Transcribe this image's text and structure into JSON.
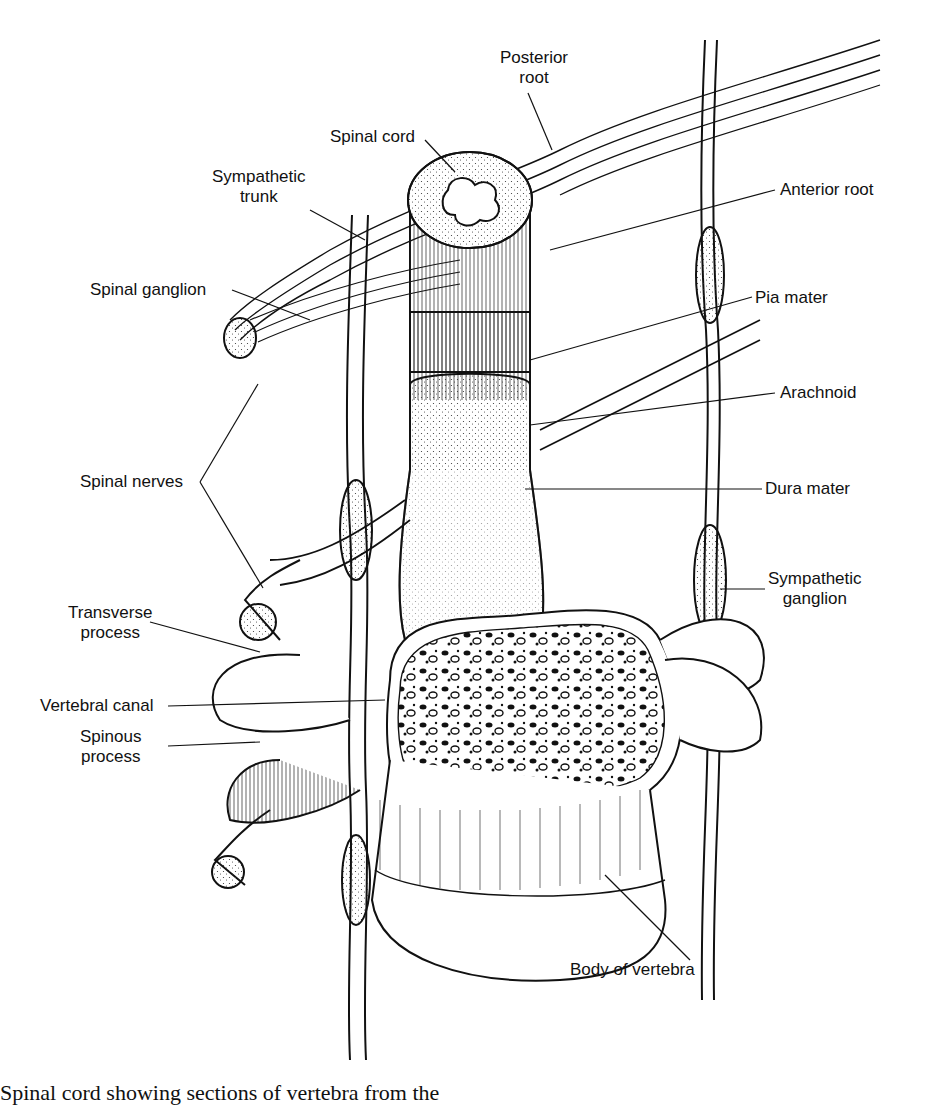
{
  "figure": {
    "labels": {
      "posterior_root": "Posterior\nroot",
      "spinal_cord": "Spinal cord",
      "sympathetic_trunk": "Sympathetic\ntrunk",
      "anterior_root": "Anterior root",
      "spinal_ganglion": "Spinal ganglion",
      "pia_mater": "Pia mater",
      "arachnoid": "Arachnoid",
      "spinal_nerves": "Spinal nerves",
      "dura_mater": "Dura mater",
      "sympathetic_ganglion": "Sympathetic\nganglion",
      "transverse_process": "Transverse\nprocess",
      "vertebral_canal": "Vertebral canal",
      "spinous_process": "Spinous\nprocess",
      "body_of_vertebra": "Body of vertebra"
    },
    "caption": "Spinal cord showing sections of vertebra from the"
  }
}
